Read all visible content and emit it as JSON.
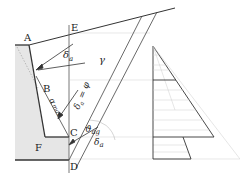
{
  "figure": {
    "type": "retaining-wall earth-pressure diagram",
    "colors": {
      "line": "#333333",
      "light_line": "#bbbbbb",
      "fill": "#e6e6e6",
      "background": "#ffffff"
    }
  },
  "labels": {
    "A": "A",
    "B": "B",
    "C": "C",
    "D": "D",
    "E": "E",
    "F": "F",
    "gamma": "γ",
    "delta_a_top": "δ",
    "delta_a_top_sub": "a",
    "delta_eq_phi": "δ",
    "delta_eq_phi_sub": "a",
    "delta_eq_phi_rest": " = φ",
    "alpha_max": "α",
    "alpha_max_sub": "max",
    "theta_ag": "ϑ",
    "theta_ag_sub": "ag",
    "delta_a_bottom": "δ",
    "delta_a_bottom_sub": "a"
  }
}
